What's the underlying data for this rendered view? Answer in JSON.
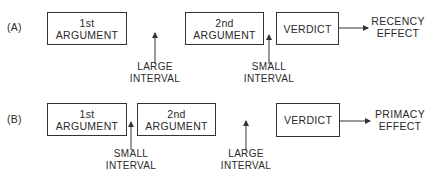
{
  "diagram": {
    "rows": [
      {
        "id": "A",
        "label": "(A)",
        "first_argument": {
          "line1": "1st",
          "line2": "ARGUMENT"
        },
        "second_argument": {
          "line1": "2nd",
          "line2": "ARGUMENT"
        },
        "verdict": "VERDICT",
        "interval_1": {
          "line1": "LARGE",
          "line2": "INTERVAL"
        },
        "interval_2": {
          "line1": "SMALL",
          "line2": "INTERVAL"
        },
        "effect": {
          "line1": "RECENCY",
          "line2": "EFFECT"
        }
      },
      {
        "id": "B",
        "label": "(B)",
        "first_argument": {
          "line1": "1st",
          "line2": "ARGUMENT"
        },
        "second_argument": {
          "line1": "2nd",
          "line2": "ARGUMENT"
        },
        "verdict": "VERDICT",
        "interval_1": {
          "line1": "SMALL",
          "line2": "INTERVAL"
        },
        "interval_2": {
          "line1": "LARGE",
          "line2": "INTERVAL"
        },
        "effect": {
          "line1": "PRIMACY",
          "line2": "EFFECT"
        }
      }
    ],
    "colors": {
      "line": "#333333",
      "text": "#2a2a2a",
      "background": "#ffffff"
    }
  }
}
